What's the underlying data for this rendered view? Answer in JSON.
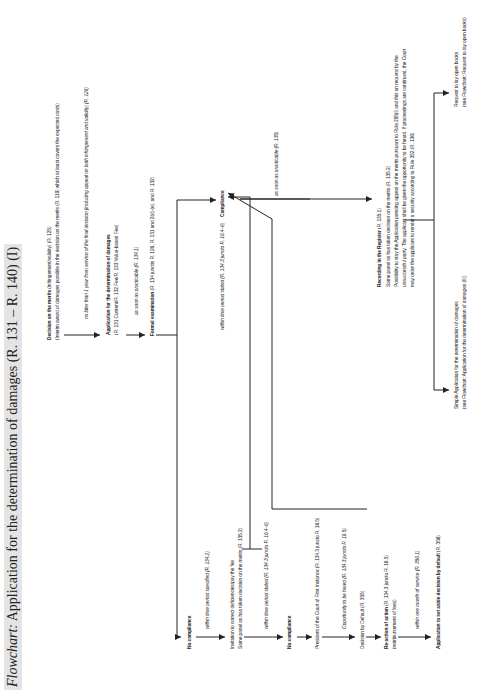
{
  "title": {
    "lead": "Flowchart:",
    "text": "Application for the determination of damages (R. 131 – R. 140) (I)"
  },
  "nodes": {
    "decision_merits": {
      "label": "Decision on the merits",
      "detail": "(infringement/validity) (R. 125)",
      "line2": "(Interim award of damages possible in the decision on the merits (R. 119) which at least covers the expected costs)"
    },
    "edge_one_year": "no later than 1 year from service of the final decision (including appeal on both infringement and validity) (R. 126)",
    "application": {
      "label": "Application for the determination of damages",
      "line2": "(R. 131 Content/R. 132 Fee/R. 133 Value-based Fee)"
    },
    "edge_asap_1341": "as soon as practicable (R. 134.1)",
    "formal_exam": {
      "label": "Formal examination",
      "detail": "(R. 134 junctis R. 126, R. 131 and 2(d)-(e), and R. 132)"
    },
    "edge_within_stated_top": "within time period stated (R. 134.3 juncto R. 16.4–6)",
    "compliance": {
      "label": "Compliance"
    },
    "edge_asap_135": "as soon as practicable (R. 135)",
    "recording": {
      "label": "Recording in the Register",
      "detail": "(R. 135.1)",
      "lines": [
        "Same panel as has taken decision on the merits (R. 135.2)",
        "Possibility to stay the Application pending appeal on the merits pursuant to Rule 295(l) and this on request by the",
        "unsuccessful party. The applicant shall be given the opportunity to be heard. If proceedings are continued, the Court",
        "may order the applicant to render a security according to Rule 352 (R. 136)"
      ]
    },
    "request_open_books": {
      "label": "Request to lay open books",
      "line2": "(see Flowchart: Request to lay open books)"
    },
    "simple_application": {
      "label": "Simple Application for the determination of damages",
      "line2": "(see Flowchart: Application for the determination of damages (II))"
    },
    "no_compliance_1": {
      "label": "No compliance"
    },
    "edge_within_specified": "within time period specified (R. 134.2)",
    "invitation": {
      "line1": "Invitation to correct deficiencies/pay the fee",
      "line2": "Same panel as has taken decision on the merits (R. 135.2)"
    },
    "edge_within_stated_mid": "within time period stated (R. 134.3 juncto R. 16.4–6)",
    "no_compliance_2": {
      "label": "No compliance"
    },
    "president": "President of the Court of First Instance (R. 134.3 juncto R. 16.5)",
    "edge_opportunity": "Opportunity to be heard (R. 134.3 juncto R. 16.5)",
    "decision_default": "Decision by Default (R. 355)",
    "reaction": {
      "label": "Re-action of action",
      "detail": "(R. 134.3 juncto R. 16.5)",
      "line2": "(reimbursement of fees)"
    },
    "edge_one_month": "within one month of service (R. 356.1)",
    "set_aside": {
      "label": "Application to set aside decision by default",
      "detail": "(R. 356)"
    }
  },
  "colors": {
    "line": "#222222",
    "title_bg": "#e4e4e4",
    "text": "#1a1a1a"
  }
}
